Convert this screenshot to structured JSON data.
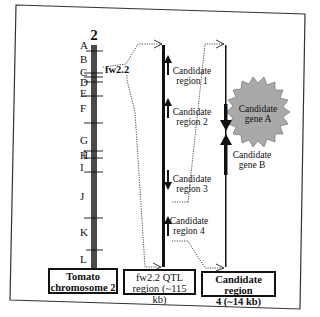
{
  "chromosome": {
    "number": "2",
    "bands": [
      "A",
      "B",
      "C",
      "D",
      "E",
      "F",
      "G",
      "H",
      "I",
      "J",
      "K",
      "L"
    ],
    "qtl_label": "fw2.2",
    "caption_line1": "Tomato",
    "caption_line2": "chromosome 2"
  },
  "qtl_region": {
    "caption_line1": "fw2.2 QTL",
    "caption_line2": "region (~115 kb)",
    "candidates": [
      {
        "line1": "Candidate",
        "line2": "region 1",
        "direction": "up"
      },
      {
        "line1": "Candidate",
        "line2": "region 2",
        "direction": "up"
      },
      {
        "line1": "Candidate",
        "line2": "region 3",
        "direction": "down"
      },
      {
        "line1": "Candidate",
        "line2": "region 4",
        "direction": "up"
      }
    ]
  },
  "candidate_region": {
    "caption_line1": "Candidate region",
    "caption_line2": "4 (~14 kb)",
    "genes": [
      {
        "line1": "Candidate",
        "line2": "gene A",
        "direction": "down",
        "highlighted": true
      },
      {
        "line1": "Candidate",
        "line2": "gene B",
        "direction": "up",
        "highlighted": false
      }
    ]
  },
  "colors": {
    "chromosome": "#4a4a4a",
    "starburst": "#a9a9a9",
    "line": "#111111"
  }
}
